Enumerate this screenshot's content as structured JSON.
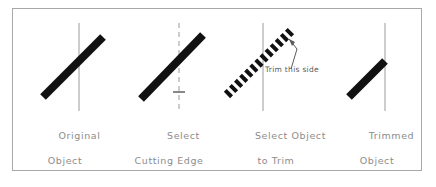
{
  "figure": {
    "border_color": "#a8a8a8",
    "background_color": "#ffffff",
    "object_color": "#111111",
    "cutting_edge_color": "#9a9a9a",
    "caption_color": "#8c8c8c",
    "annotation_color": "#5a5a5a"
  },
  "panels": [
    {
      "id": "original-object",
      "caption_line1": "Original",
      "caption_line2": "Object",
      "object_style": "solid",
      "reference_line_style": "solid",
      "has_pick_marker": false,
      "annotation": null
    },
    {
      "id": "select-cutting-edge",
      "caption_line1": "Select",
      "caption_line2": "Cutting Edge",
      "object_style": "solid",
      "reference_line_style": "dashed",
      "has_pick_marker": true,
      "annotation": null
    },
    {
      "id": "select-object-to-trim",
      "caption_line1": "Select Object",
      "caption_line2": "to Trim",
      "object_style": "selected-dashed",
      "reference_line_style": "solid",
      "has_pick_marker": false,
      "annotation": "Trim this side"
    },
    {
      "id": "trimmed-object",
      "caption_line1": "Trimmed",
      "caption_line2": "Object",
      "object_style": "solid-trimmed",
      "reference_line_style": "solid",
      "has_pick_marker": false,
      "annotation": null
    }
  ]
}
